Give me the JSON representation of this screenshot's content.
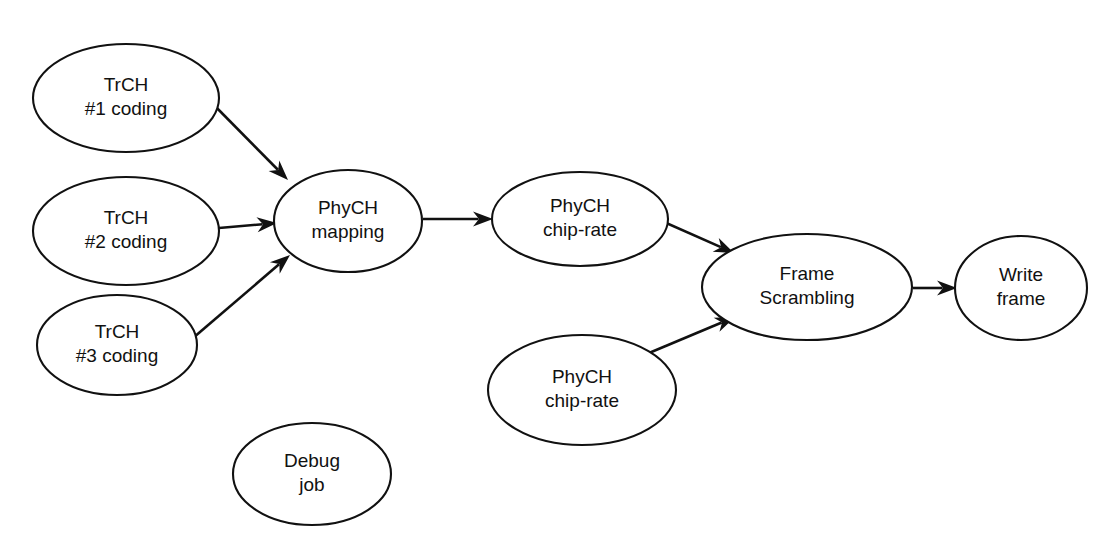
{
  "diagram": {
    "type": "directed-graph",
    "title": "",
    "background_color": "#ffffff",
    "stroke_color": "#111111",
    "node_shape": "ellipse",
    "nodes": [
      {
        "id": "trch1",
        "name": "trch-1-coding",
        "line1": "TrCH",
        "line2": "#1 coding",
        "cx": 126,
        "cy": 98,
        "rx": 93,
        "ry": 54
      },
      {
        "id": "trch2",
        "name": "trch-2-coding",
        "line1": "TrCH",
        "line2": "#2 coding",
        "cx": 126,
        "cy": 231,
        "rx": 93,
        "ry": 54
      },
      {
        "id": "trch3",
        "name": "trch-3-coding",
        "line1": "TrCH",
        "line2": "#3 coding",
        "cx": 117,
        "cy": 345,
        "rx": 80,
        "ry": 50
      },
      {
        "id": "phych_mapping",
        "name": "phych-mapping",
        "line1": "PhyCH",
        "line2": "mapping",
        "cx": 348,
        "cy": 221,
        "rx": 74,
        "ry": 51
      },
      {
        "id": "phych_chiprate_upper",
        "name": "phych-chip-rate-upper",
        "line1": "PhyCH",
        "line2": "chip-rate",
        "cx": 580,
        "cy": 219,
        "rx": 88,
        "ry": 47
      },
      {
        "id": "phych_chiprate_lower",
        "name": "phych-chip-rate-lower",
        "line1": "PhyCH",
        "line2": "chip-rate",
        "cx": 582,
        "cy": 390,
        "rx": 94,
        "ry": 55
      },
      {
        "id": "frame_scrambling",
        "name": "frame-scrambling",
        "line1": "Frame",
        "line2": "Scrambling",
        "cx": 807,
        "cy": 287,
        "rx": 105,
        "ry": 53
      },
      {
        "id": "write_frame",
        "name": "write-frame",
        "line1": "Write",
        "line2": "frame",
        "cx": 1021,
        "cy": 288,
        "rx": 66,
        "ry": 52
      },
      {
        "id": "debug_job",
        "name": "debug-job",
        "line1": "Debug",
        "line2": "job",
        "cx": 312,
        "cy": 474,
        "rx": 79,
        "ry": 51
      }
    ],
    "edges": [
      {
        "id": "e1",
        "name": "edge-trch1-to-phych-mapping",
        "from": "trch1",
        "to": "phych_mapping",
        "x1": 208,
        "y1": 99,
        "x2": 288,
        "y2": 180
      },
      {
        "id": "e2",
        "name": "edge-trch2-to-phych-mapping",
        "from": "trch2",
        "to": "phych_mapping",
        "x1": 219,
        "y1": 228,
        "x2": 277,
        "y2": 223
      },
      {
        "id": "e3",
        "name": "edge-trch3-to-phych-mapping",
        "from": "trch3",
        "to": "phych_mapping",
        "x1": 193,
        "y1": 338,
        "x2": 290,
        "y2": 255
      },
      {
        "id": "e4",
        "name": "edge-phych-mapping-to-chip-rate-upper",
        "from": "phych_mapping",
        "to": "phych_chiprate_upper",
        "x1": 423,
        "y1": 219,
        "x2": 493,
        "y2": 219
      },
      {
        "id": "e5",
        "name": "edge-chip-rate-upper-to-frame-scrambling",
        "from": "phych_chiprate_upper",
        "to": "frame_scrambling",
        "x1": 655,
        "y1": 218,
        "x2": 734,
        "y2": 253
      },
      {
        "id": "e6",
        "name": "edge-chip-rate-lower-to-frame-scrambling",
        "from": "phych_chiprate_lower",
        "to": "frame_scrambling",
        "x1": 649,
        "y1": 353,
        "x2": 735,
        "y2": 317
      },
      {
        "id": "e7",
        "name": "edge-frame-scrambling-to-write-frame",
        "from": "frame_scrambling",
        "to": "write_frame",
        "x1": 913,
        "y1": 288,
        "x2": 957,
        "y2": 288
      }
    ]
  }
}
